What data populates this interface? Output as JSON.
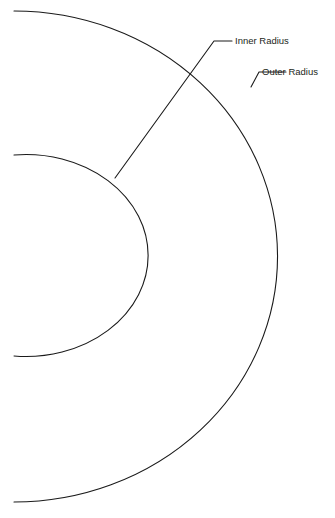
{
  "canvas": {
    "width": 335,
    "height": 518,
    "background": "#ffffff",
    "stroke_color": "#1a1a1a",
    "text_color": "#231f20"
  },
  "diagram": {
    "type": "concentric-arc-annotation",
    "center": {
      "x": 14,
      "y": 256
    },
    "arcs": [
      {
        "name": "inner-arc",
        "radius": 122,
        "start": {
          "x": 14,
          "y": 155
        },
        "end": {
          "x": 14,
          "y": 356
        },
        "rightmost": {
          "x": 136,
          "y": 257
        },
        "path": "M 14 155 A 122 101 0 1 1 14 356"
      },
      {
        "name": "outer-arc",
        "radius": 263,
        "start": {
          "x": 14,
          "y": 11
        },
        "end": {
          "x": 14,
          "y": 502
        },
        "rightmost": {
          "x": 277,
          "y": 257
        },
        "path": "M 14 11 A 263 245 0 1 1 14 502"
      }
    ],
    "leaders": [
      {
        "name": "inner-radius-leader",
        "path": "M 115 178 L 214 41 L 232 41",
        "anchor": {
          "x": 115,
          "y": 178
        },
        "elbow": {
          "x": 214,
          "y": 41
        },
        "tip": {
          "x": 232,
          "y": 41
        }
      },
      {
        "name": "outer-radius-leader",
        "path": "M 251 87 L 259 72 L 286 72",
        "anchor": {
          "x": 251,
          "y": 87
        },
        "elbow": {
          "x": 259,
          "y": 72
        },
        "tip": {
          "x": 286,
          "y": 72
        }
      }
    ]
  },
  "labels": {
    "inner_radius": {
      "text": "Inner Radius",
      "x": 235,
      "y": 41
    },
    "outer_radius": {
      "text": "Outer Radius",
      "x": 262,
      "y": 72
    }
  }
}
